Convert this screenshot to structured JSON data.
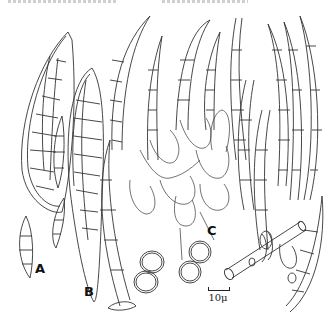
{
  "figure": {
    "labels": {
      "A": "A",
      "B": "B",
      "C": "C"
    },
    "scale_bar": {
      "label": "10μ"
    },
    "colors": {
      "ink": "#333333",
      "background": "#ffffff"
    }
  }
}
